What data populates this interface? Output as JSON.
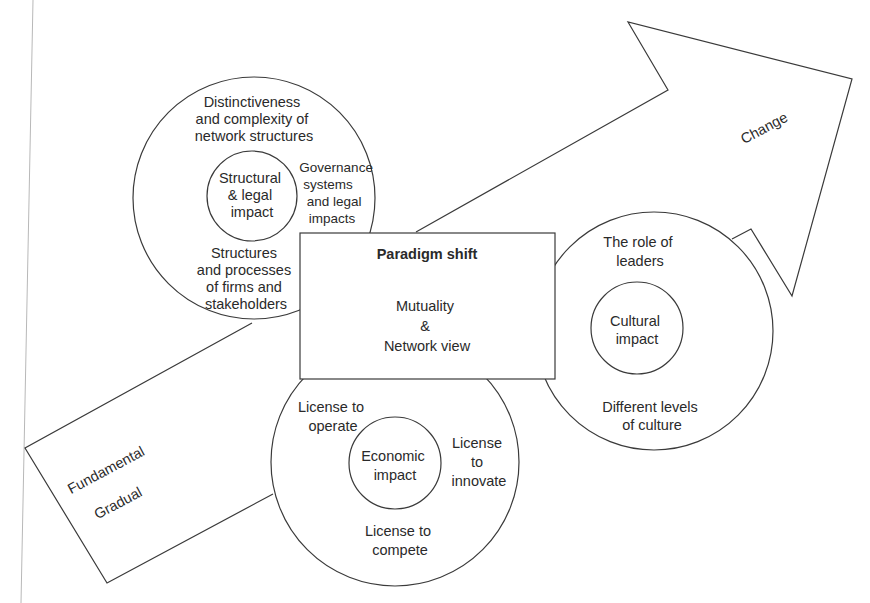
{
  "diagram": {
    "arrow": {
      "label_change": "Change",
      "label_fundamental": "Fundamental",
      "label_gradual": "Gradual"
    },
    "center_box": {
      "title": "Paradigm shift",
      "line1": "Mutuality",
      "line2": "&",
      "line3": "Network view"
    },
    "structural_circle": {
      "core": [
        "Structural",
        "& legal",
        "impact"
      ],
      "top": [
        "Distinctiveness",
        "and complexity of",
        "network structures"
      ],
      "right": [
        "Governance",
        "systems",
        "and legal",
        "impacts"
      ],
      "bottom": [
        "Structures",
        "and processes",
        "of firms and",
        "stakeholders"
      ]
    },
    "cultural_circle": {
      "core": [
        "Cultural",
        "impact"
      ],
      "top": [
        "The role of",
        "leaders"
      ],
      "bottom": [
        "Different levels",
        "of culture"
      ]
    },
    "economic_circle": {
      "core": [
        "Economic",
        "impact"
      ],
      "top_left": [
        "License to",
        "operate"
      ],
      "right": [
        "License",
        "to",
        "innovate"
      ],
      "bottom": [
        "License to",
        "compete"
      ]
    },
    "colors": {
      "line": "#3a3a3a",
      "text": "#2a2a2a",
      "background": "#ffffff"
    }
  }
}
